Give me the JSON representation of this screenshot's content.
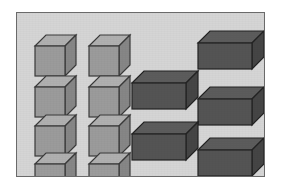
{
  "figure": {
    "title": "Blocks comparison figure",
    "caption": "",
    "panel": {
      "background_color": "#d5d5d5",
      "border_color": "#6a6a6a",
      "x": 16,
      "y": 12,
      "width": 249,
      "height": 165
    },
    "page_background_color": "#ffffff"
  },
  "groups": [
    {
      "id": "light-cube-group",
      "name": "small light cubes",
      "count": 8,
      "columns": 2,
      "rows": 4,
      "shape": "cube",
      "colors": {
        "front": "#9b9b9b",
        "top": "#b0b0b0",
        "side": "#868686",
        "outline": "#3a3a3a"
      },
      "size": {
        "front_width": 30,
        "front_height": 30,
        "depth_x": 11,
        "depth_y": 11
      },
      "items": [
        {
          "label": "cube-1",
          "x": 18,
          "y": 22
        },
        {
          "label": "cube-2",
          "x": 72,
          "y": 22
        },
        {
          "label": "cube-3",
          "x": 18,
          "y": 63
        },
        {
          "label": "cube-4",
          "x": 72,
          "y": 63
        },
        {
          "label": "cube-5",
          "x": 18,
          "y": 102
        },
        {
          "label": "cube-6",
          "x": 72,
          "y": 102
        },
        {
          "label": "cube-7",
          "x": 18,
          "y": 140
        },
        {
          "label": "cube-8",
          "x": 72,
          "y": 140
        }
      ]
    },
    {
      "id": "dark-box-group",
      "name": "large dark rectangular blocks",
      "count": 6,
      "shape": "cuboid",
      "colors": {
        "front": "#545454",
        "top": "#5c5c5c",
        "side": "#454545",
        "outline": "#232323"
      },
      "size": {
        "front_width": 54,
        "front_height": 26,
        "depth_x": 12,
        "depth_y": 12
      },
      "items": [
        {
          "label": "box-1",
          "x": 193,
          "y": 18
        },
        {
          "label": "box-2",
          "x": 127,
          "y": 58
        },
        {
          "label": "box-3",
          "x": 193,
          "y": 74
        },
        {
          "label": "box-4",
          "x": 127,
          "y": 109
        },
        {
          "label": "box-5",
          "x": 193,
          "y": 125
        }
      ]
    }
  ],
  "counts": {
    "light_cubes_label": "8",
    "dark_blocks_label": "6"
  }
}
